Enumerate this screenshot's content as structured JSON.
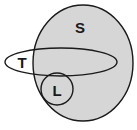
{
  "diagram": {
    "type": "euler-venn-diagram",
    "background_color": "#ffffff",
    "fill_color": "#d6d6d6",
    "stroke_color": "#1a1a1a",
    "label_color": "#1a1a1a",
    "sets": [
      {
        "id": "S",
        "label": "S",
        "shape": "ellipse",
        "filled": true,
        "fill_color": "#d6d6d6",
        "cx": 83,
        "cy": 63,
        "rx": 50,
        "ry": 58,
        "label_x": 80,
        "label_y": 27
      },
      {
        "id": "T",
        "label": "T",
        "shape": "ellipse",
        "filled": false,
        "cx": 61,
        "cy": 62,
        "rx": 56,
        "ry": 14,
        "label_x": 22,
        "label_y": 62
      },
      {
        "id": "L",
        "label": "L",
        "shape": "circle",
        "filled": false,
        "cx": 57,
        "cy": 89,
        "rx": 16,
        "ry": 16,
        "label_x": 57,
        "label_y": 90
      }
    ]
  }
}
